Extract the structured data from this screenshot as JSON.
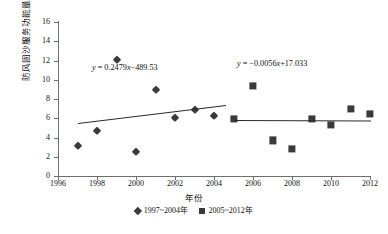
{
  "chart_data": {
    "type": "scatter",
    "title": "",
    "xlabel": "年份",
    "ylabel": "防风固沙服务功能量/亿t",
    "xlim": [
      1996,
      2012
    ],
    "ylim": [
      0,
      16
    ],
    "xticks": [
      1996,
      1998,
      2000,
      2002,
      2004,
      2006,
      2008,
      2010,
      2012
    ],
    "yticks": [
      0,
      2,
      4,
      6,
      8,
      10,
      12,
      14,
      16
    ],
    "grid": false,
    "legend_position": "bottom",
    "series": [
      {
        "name": "1997~2004年",
        "marker": "diamond",
        "color": "#3a3a3a",
        "x": [
          1997,
          1998,
          1999,
          2000,
          2001,
          2002,
          2003,
          2004
        ],
        "values": [
          3.15,
          4.7,
          12.1,
          2.55,
          8.9,
          6.0,
          6.85,
          6.25
        ]
      },
      {
        "name": "2005~2012年",
        "marker": "square",
        "color": "#3a3a3a",
        "x": [
          2005,
          2006,
          2007,
          2008,
          2009,
          2010,
          2011,
          2012
        ],
        "values": [
          5.95,
          9.4,
          3.7,
          2.85,
          5.95,
          5.3,
          7.0,
          6.45
        ]
      }
    ],
    "trendlines": [
      {
        "name": "trend-1997-2004",
        "equation": "y = 0.2479x−489.53",
        "slope": 0.2479,
        "intercept": -489.53,
        "x_start": 1997,
        "x_end": 2004.6
      },
      {
        "name": "trend-2005-2012",
        "equation": "y = −0.0056x+17.033",
        "slope": -0.0056,
        "intercept": 17.033,
        "x_start": 2005,
        "x_end": 2012
      }
    ],
    "annotations": [
      {
        "name": "equation-left",
        "text_parts": {
          "var": "y",
          "rest": " = 0.2479",
          "xvar": "x",
          "tail": "−489.53"
        }
      },
      {
        "name": "equation-right",
        "text_parts": {
          "var": "y",
          "rest": " = −0.0056",
          "xvar": "x",
          "tail": "+17.033"
        }
      }
    ]
  },
  "axes": {
    "y_tick_labels": [
      "0",
      "2",
      "4",
      "6",
      "8",
      "10",
      "12",
      "14",
      "16"
    ],
    "x_tick_labels": [
      "1996",
      "1998",
      "2000",
      "2002",
      "2004",
      "2006",
      "2008",
      "2010",
      "2012"
    ],
    "y_title": "防风固沙服务功能量/亿t",
    "x_title": "年份"
  },
  "legend": {
    "items": [
      {
        "label": "1997~2004年",
        "marker": "diamond"
      },
      {
        "label": "2005~2012年",
        "marker": "square"
      }
    ]
  },
  "equations": {
    "left": {
      "y": "y",
      "eq": " = 0.2479",
      "x": "x",
      "tail": "−489.53"
    },
    "right": {
      "y": "y",
      "eq": " = −0.0056",
      "x": "x",
      "tail": "+17.033"
    }
  },
  "colors": {
    "marker": "#3a3a3a",
    "axis": "#6e6e6e",
    "trend": "#2b2b2b",
    "text": "#111111",
    "background": "#ffffff"
  }
}
